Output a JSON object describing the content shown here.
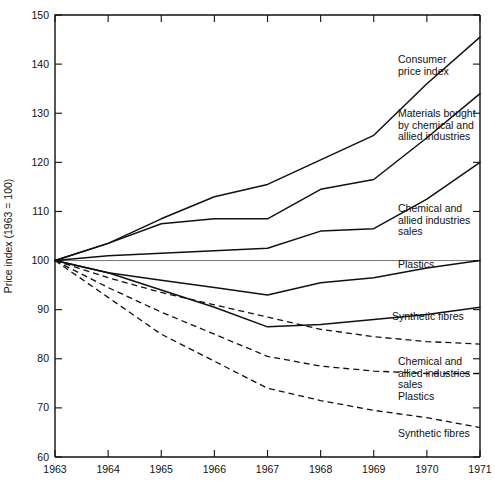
{
  "chart_data": {
    "type": "line",
    "title": "",
    "xlabel": "",
    "ylabel": "Price index (1963 = 100)",
    "xlim": [
      1963,
      1971
    ],
    "ylim": [
      60,
      150
    ],
    "ytick_step": 10,
    "grid": false,
    "legend": "inline-right-labels",
    "reference_line": 100,
    "x": [
      1963,
      1964,
      1965,
      1966,
      1967,
      1968,
      1969,
      1970,
      1971
    ],
    "categories": [
      "1963",
      "1964",
      "1965",
      "1966",
      "1967",
      "1968",
      "1969",
      "1970",
      "1971"
    ],
    "yticks": [
      60,
      70,
      80,
      90,
      100,
      110,
      120,
      130,
      140,
      150
    ],
    "series": [
      {
        "name": "Consumer price index",
        "style": "solid",
        "label": "Consumer price index",
        "values": [
          100,
          103.5,
          108.5,
          113,
          115.5,
          120.5,
          125.5,
          136,
          145.5
        ]
      },
      {
        "name": "Materials bought by chemical and allied industries",
        "style": "solid",
        "label": "Materials bought by chemical and allied industries",
        "values": [
          100,
          103.5,
          107.5,
          108.5,
          108.5,
          114.5,
          116.5,
          125,
          134
        ]
      },
      {
        "name": "Chemical and allied industries sales",
        "style": "solid",
        "label": "Chemical and allied industries sales",
        "values": [
          100,
          101,
          101.5,
          102,
          102.5,
          106,
          106.5,
          112.5,
          120
        ]
      },
      {
        "name": "Plastics (solid)",
        "style": "solid",
        "label": "Plastics",
        "values": [
          100,
          97.5,
          96,
          94.5,
          93,
          95.5,
          96.5,
          98.5,
          100
        ]
      },
      {
        "name": "Synthetic fibres (solid)",
        "style": "solid",
        "label": "Synthetic fibres",
        "values": [
          100,
          97.5,
          94,
          90.5,
          86.5,
          87,
          88,
          89,
          90.5
        ]
      },
      {
        "name": "Chemical and allied industries sales (dashed)",
        "style": "dashed",
        "label": "Chemical and allied industries sales",
        "values": [
          100,
          96.5,
          93.5,
          91,
          88.5,
          86,
          84.5,
          83.5,
          83
        ]
      },
      {
        "name": "Plastics (dashed)",
        "style": "dashed",
        "label": "Plastics",
        "values": [
          100,
          94.5,
          89.5,
          85,
          80.5,
          78.5,
          77.5,
          77,
          77
        ]
      },
      {
        "name": "Synthetic fibres (dashed)",
        "style": "dashed",
        "label": "Synthetic fibres",
        "values": [
          100,
          92.5,
          85,
          79.5,
          74,
          71.5,
          69.5,
          68,
          66
        ]
      }
    ],
    "annotations": [
      {
        "id": "annot-cpi",
        "lines": [
          "Consumer",
          "price index"
        ],
        "x": 398,
        "y": 63
      },
      {
        "id": "annot-materials",
        "lines": [
          "Materials bought",
          "by chemical and",
          "allied industries"
        ],
        "x": 398,
        "y": 117
      },
      {
        "id": "annot-chem-sales-solid",
        "lines": [
          "Chemical and",
          "allied industries",
          "sales"
        ],
        "x": 398,
        "y": 212
      },
      {
        "id": "annot-plastics-solid",
        "lines": [
          "Plastics"
        ],
        "x": 398,
        "y": 268
      },
      {
        "id": "annot-synthetic-solid",
        "lines": [
          "Synthetic fibres"
        ],
        "x": 392,
        "y": 320
      },
      {
        "id": "annot-chem-sales-dashed",
        "lines": [
          "Chemical and",
          "allied industries",
          "sales"
        ],
        "x": 398,
        "y": 365
      },
      {
        "id": "annot-plastics-dashed",
        "lines": [
          "Plastics"
        ],
        "x": 398,
        "y": 400
      },
      {
        "id": "annot-synthetic-dashed",
        "lines": [
          "Synthetic fibres"
        ],
        "x": 398,
        "y": 437
      }
    ]
  },
  "axes": {
    "y_title": "Price index (1963 = 100)",
    "y_ticks": [
      "150",
      "140",
      "130",
      "120",
      "110",
      "100",
      "90",
      "80",
      "70",
      "60"
    ],
    "x_ticks": [
      "1963",
      "1964",
      "1965",
      "1966",
      "1967",
      "1968",
      "1969",
      "1970",
      "1971"
    ]
  },
  "colors": {
    "ink": "#111111",
    "reference": "#777777",
    "background": "#ffffff"
  }
}
